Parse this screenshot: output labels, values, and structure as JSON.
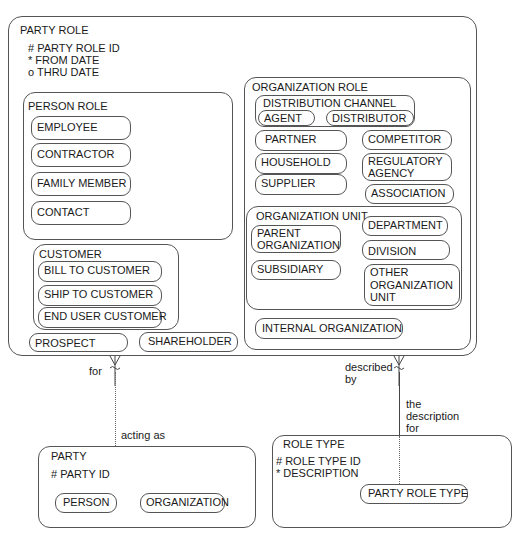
{
  "party_role": {
    "title": "PARTY ROLE",
    "attributes": [
      "# PARTY ROLE ID",
      "*  FROM DATE",
      "o THRU DATE"
    ],
    "person_role": {
      "title": "PERSON ROLE",
      "items": [
        "EMPLOYEE",
        "CONTRACTOR",
        "FAMILY MEMBER",
        "CONTACT"
      ]
    },
    "customer": {
      "title": "CUSTOMER",
      "items": [
        "BILL TO CUSTOMER",
        "SHIP TO CUSTOMER",
        "END USER CUSTOMER"
      ]
    },
    "prospect": "PROSPECT",
    "shareholder": "SHAREHOLDER",
    "organization_role": {
      "title": "ORGANIZATION ROLE",
      "distribution_channel": {
        "title": "DISTRIBUTION CHANNEL",
        "items": [
          "AGENT",
          "DISTRIBUTOR"
        ]
      },
      "left_items": [
        "PARTNER",
        "HOUSEHOLD",
        "SUPPLIER"
      ],
      "right_items": [
        "COMPETITOR",
        "REGULATORY AGENCY",
        "ASSOCIATION"
      ],
      "organization_unit": {
        "title": "ORGANIZATION UNIT",
        "left_items": [
          "PARENT ORGANIZATION",
          "SUBSIDIARY"
        ],
        "right_items": [
          "DEPARTMENT",
          "DIVISION",
          "OTHER ORGANIZATION UNIT"
        ]
      },
      "internal_organization": "INTERNAL ORGANIZATION"
    }
  },
  "relationships": {
    "party": {
      "near_role": "for",
      "near_party": "acting as"
    },
    "role_type": {
      "near_role": "described by",
      "near_type": "the description for"
    }
  },
  "party": {
    "title": "PARTY",
    "attributes": [
      "# PARTY ID"
    ],
    "items": [
      "PERSON",
      "ORGANIZATION"
    ]
  },
  "role_type": {
    "title": "ROLE TYPE",
    "attributes": [
      "#  ROLE TYPE ID",
      "* DESCRIPTION"
    ],
    "items": [
      "PARTY ROLE TYPE"
    ]
  }
}
